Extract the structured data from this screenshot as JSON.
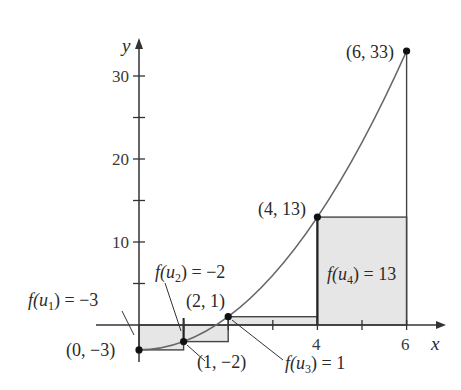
{
  "diagram": {
    "function": "f(x) = x^2 - 3",
    "axes": {
      "x_label": "x",
      "y_label": "y",
      "x_ticks": [
        {
          "value": 1,
          "label": ""
        },
        {
          "value": 2,
          "label": ""
        },
        {
          "value": 3,
          "label": ""
        },
        {
          "value": 4,
          "label": "4"
        },
        {
          "value": 5,
          "label": ""
        },
        {
          "value": 6,
          "label": "6"
        }
      ],
      "y_ticks": [
        {
          "value": 5,
          "label": ""
        },
        {
          "value": 10,
          "label": "10"
        },
        {
          "value": 15,
          "label": ""
        },
        {
          "value": 20,
          "label": "20"
        },
        {
          "value": 25,
          "label": ""
        },
        {
          "value": 30,
          "label": "30"
        }
      ]
    },
    "points": [
      {
        "x": 0,
        "y": -3,
        "label": "(0, −3)"
      },
      {
        "x": 1,
        "y": -2,
        "label": "(1, −2)"
      },
      {
        "x": 2,
        "y": 1,
        "label": "(2, 1)"
      },
      {
        "x": 4,
        "y": 13,
        "label": "(4, 13)"
      },
      {
        "x": 6,
        "y": 33,
        "label": "(6, 33)"
      }
    ],
    "rectangles": [
      {
        "x0": 0,
        "x1": 1,
        "height": -3,
        "label": "f(u1) = −3"
      },
      {
        "x0": 1,
        "x1": 2,
        "height": -2,
        "label": "f(u2) = −2"
      },
      {
        "x0": 2,
        "x1": 4,
        "height": 1,
        "label": "f(u3) = 1"
      },
      {
        "x0": 4,
        "x1": 6,
        "height": 13,
        "label": "f(u4) = 13"
      }
    ],
    "labels": {
      "fu1_prefix": "f(u",
      "fu1_sub": "1",
      "fu1_suffix": ") = −3",
      "fu2_prefix": "f(u",
      "fu2_sub": "2",
      "fu2_suffix": ") = −2",
      "fu3_prefix": "f(u",
      "fu3_sub": "3",
      "fu3_suffix": ") = 1",
      "fu4_prefix": "f(u",
      "fu4_sub": "4",
      "fu4_suffix": ") = 13"
    },
    "colors": {
      "rect_fill": "#e6e6e6",
      "rect_stroke": "#444444",
      "curve": "#666666",
      "axis": "#333333",
      "point": "#111111"
    }
  }
}
